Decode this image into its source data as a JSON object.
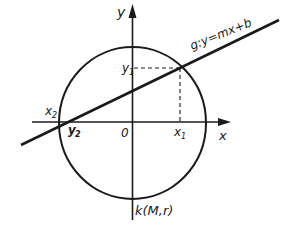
{
  "diagram": {
    "type": "circle-line-intersection",
    "colors": {
      "ink": "#1a1a1a",
      "background": "#ffffff"
    },
    "axes": {
      "x_label": "x",
      "y_label": "y",
      "origin_label": "0"
    },
    "circle": {
      "label": "k(M,r)"
    },
    "line": {
      "label": "g:y=mx+b"
    },
    "points": {
      "x1": "x",
      "x1_sub": "1",
      "y1": "y",
      "y1_sub": "1",
      "x2": "x",
      "x2_sub": "2",
      "y2": "y",
      "y2_sub": "2"
    }
  }
}
